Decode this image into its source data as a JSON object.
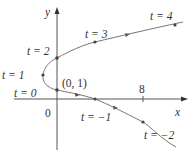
{
  "figure": {
    "axes": {
      "x_label": "x",
      "y_label": "y",
      "origin_label": "0",
      "x_tick_label": "8"
    },
    "point_label": "(0, 1)",
    "parameter_labels": {
      "t4": "t = 4",
      "t3": "t = 3",
      "t2": "t = 2",
      "t1": "t = 1",
      "t0": "t = 0",
      "tm1": "t = −1",
      "tm2": "t = −2"
    },
    "points": [
      {
        "t": -2,
        "x": 8,
        "y": -1
      },
      {
        "t": -1,
        "x": 3,
        "y": 0
      },
      {
        "t": 0,
        "x": 0,
        "y": 1
      },
      {
        "t": 1,
        "x": -1,
        "y": 2
      },
      {
        "t": 2,
        "x": 0,
        "y": 3
      },
      {
        "t": 3,
        "x": 3,
        "y": 4
      },
      {
        "t": 4,
        "x": 8,
        "y": 5
      }
    ],
    "colors": {
      "axis": "#555555",
      "curve": "#777777",
      "text": "#333333"
    }
  }
}
